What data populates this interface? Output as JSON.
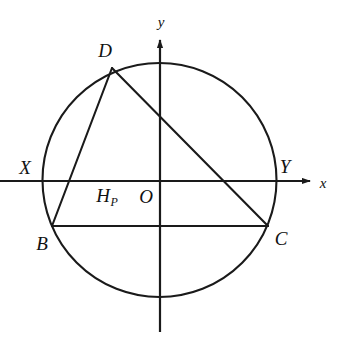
{
  "figure": {
    "kind": "geometry-diagram",
    "width": 342,
    "height": 348,
    "background_color": "#ffffff",
    "stroke_color": "#1a1a1a"
  },
  "axes": {
    "x_axis": {
      "label": "x",
      "label_x": 323,
      "label_y": 183,
      "y": 181,
      "x_start": 0,
      "x_end": 312,
      "arrow": "right"
    },
    "y_axis": {
      "label": "y",
      "label_x": 161,
      "label_y": 22,
      "x": 160,
      "y_start": 38,
      "y_end": 332,
      "arrow": "up"
    },
    "origin": {
      "label": "O",
      "label_x": 146,
      "label_y": 196,
      "x": 160,
      "y": 181
    }
  },
  "circle": {
    "center_x": 159.5,
    "center_y": 180,
    "radius": 117,
    "stroke_width": 2.1
  },
  "points": [
    {
      "id": "D",
      "label": "D",
      "x": 112,
      "y": 68,
      "label_x": 105,
      "label_y": 50
    },
    {
      "id": "B",
      "label": "B",
      "x": 52,
      "y": 226,
      "label_x": 42,
      "label_y": 243
    },
    {
      "id": "C",
      "label": "C",
      "x": 268,
      "y": 226,
      "label_x": 281,
      "label_y": 238
    },
    {
      "id": "X",
      "label": "X",
      "x": 43,
      "y": 181,
      "label_x": 25,
      "label_y": 167
    },
    {
      "id": "Y",
      "label": "Y",
      "x": 276,
      "y": 181,
      "label_x": 285,
      "label_y": 166
    }
  ],
  "foot_point": {
    "base": "H",
    "subscript": "P",
    "label_x": 107,
    "label_y": 197
  },
  "segments": [
    {
      "id": "DB",
      "from": "D",
      "to": "B",
      "x1": 112,
      "y1": 68,
      "x2": 52,
      "y2": 226
    },
    {
      "id": "DC",
      "from": "D",
      "to": "C",
      "x1": 112,
      "y1": 68,
      "x2": 268,
      "y2": 226
    },
    {
      "id": "BC",
      "from": "B",
      "to": "C",
      "x1": 52,
      "y1": 226,
      "x2": 268,
      "y2": 226
    }
  ]
}
